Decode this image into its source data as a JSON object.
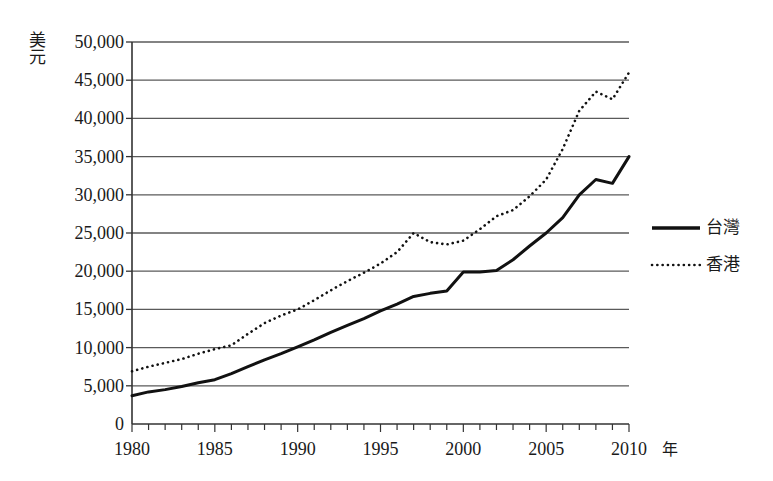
{
  "chart_data": {
    "type": "line",
    "title": "",
    "xlabel": "年",
    "ylabel": "美元",
    "xlim": [
      1980,
      2010
    ],
    "ylim": [
      0,
      50000
    ],
    "grid": true,
    "legend_position": "right",
    "y_ticks": [
      "0",
      "5,000",
      "10,000",
      "15,000",
      "20,000",
      "25,000",
      "30,000",
      "35,000",
      "40,000",
      "45,000",
      "50,000"
    ],
    "y_tick_values": [
      0,
      5000,
      10000,
      15000,
      20000,
      25000,
      30000,
      35000,
      40000,
      45000,
      50000
    ],
    "x_ticks": [
      "1980",
      "1985",
      "1990",
      "1995",
      "2000",
      "2005",
      "2010"
    ],
    "x_tick_values": [
      1980,
      1985,
      1990,
      1995,
      2000,
      2005,
      2010
    ],
    "x_minor_step": 1,
    "x": [
      1980,
      1981,
      1982,
      1983,
      1984,
      1985,
      1986,
      1987,
      1988,
      1989,
      1990,
      1991,
      1992,
      1993,
      1994,
      1995,
      1996,
      1997,
      1998,
      1999,
      2000,
      2001,
      2002,
      2003,
      2004,
      2005,
      2006,
      2007,
      2008,
      2009,
      2010
    ],
    "series": [
      {
        "name": "台灣",
        "style": "solid",
        "color": "#111111",
        "values": [
          3700,
          4200,
          4500,
          4900,
          5400,
          5800,
          6600,
          7500,
          8400,
          9200,
          10100,
          11000,
          12000,
          12900,
          13800,
          14800,
          15700,
          16700,
          17100,
          17400,
          19900,
          19900,
          20100,
          21500,
          23300,
          25000,
          27000,
          30000,
          32000,
          31500,
          35000
        ]
      },
      {
        "name": "香港",
        "style": "dotted",
        "color": "#111111",
        "values": [
          6900,
          7500,
          8000,
          8500,
          9200,
          9800,
          10300,
          11800,
          13200,
          14200,
          15000,
          16200,
          17500,
          18700,
          19800,
          21000,
          22500,
          25000,
          23800,
          23500,
          24000,
          25500,
          27200,
          28000,
          29800,
          32000,
          36000,
          41000,
          43500,
          42500,
          46000
        ]
      }
    ]
  }
}
